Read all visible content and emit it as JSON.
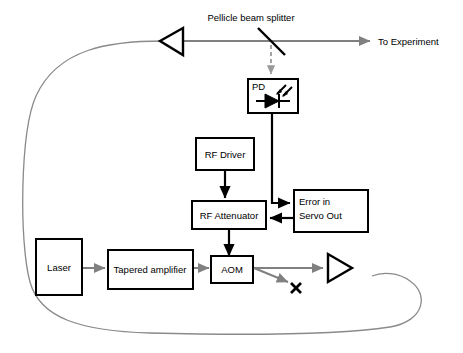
{
  "diagram": {
    "colors": {
      "signal": "#000000",
      "beam": "#808080",
      "fiber": "#8a8a8a",
      "dashed_pickoff": "#9a9a9a",
      "background": "#ffffff"
    },
    "blocks": [
      {
        "id": "laser",
        "label": "Laser"
      },
      {
        "id": "tapered-amplifier",
        "label": "Tapered amplifier"
      },
      {
        "id": "aom",
        "label": "AOM"
      },
      {
        "id": "rf-attenuator",
        "label": "RF Attenuator"
      },
      {
        "id": "rf-driver",
        "label": "RF Driver"
      },
      {
        "id": "photodiode",
        "label": "PD"
      },
      {
        "id": "error-servo",
        "label_line1": "Error in",
        "label_line2": "Servo Out"
      }
    ],
    "annotations": [
      {
        "id": "pellicle-beam-splitter",
        "label": "Pellicle beam splitter"
      },
      {
        "id": "to-experiment",
        "label": "To Experiment"
      },
      {
        "id": "beam-dump",
        "label": "✘"
      }
    ],
    "icons": [
      {
        "id": "mirror-left",
        "name": "mirror-triangle-left-icon"
      },
      {
        "id": "mirror-right",
        "name": "mirror-triangle-right-icon"
      },
      {
        "id": "photodiode-symbol",
        "name": "photodiode-symbol-icon"
      },
      {
        "id": "beam-splitter-line",
        "name": "beam-splitter-icon"
      }
    ]
  }
}
